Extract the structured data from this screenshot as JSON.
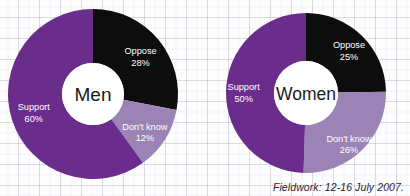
{
  "colors": {
    "support": "#6B2D8C",
    "oppose": "#0D0D0D",
    "dont_know": "#9B83B5",
    "hole": "#FFFFFF",
    "label_text": "#FFFFFF",
    "center_text": "#1A1A1A",
    "background": "#FDFDFE",
    "grid_line": "#A8A0BE",
    "footer_text": "#2C2330"
  },
  "footer": {
    "text": "Fieldwork: 12-16 July 2007."
  },
  "charts": [
    {
      "id": "men",
      "center_label": "Men",
      "segments": [
        {
          "label": "Oppose",
          "value": 28,
          "value_text": "28%",
          "color_key": "oppose"
        },
        {
          "label": "Don't know",
          "value": 12,
          "value_text": "12%",
          "color_key": "dont_know"
        },
        {
          "label": "Support",
          "value": 60,
          "value_text": "60%",
          "color_key": "support"
        }
      ]
    },
    {
      "id": "women",
      "center_label": "Women",
      "segments": [
        {
          "label": "Oppose",
          "value": 25,
          "value_text": "25%",
          "color_key": "oppose"
        },
        {
          "label": "Don't know",
          "value": 26,
          "value_text": "26%",
          "color_key": "dont_know"
        },
        {
          "label": "Support",
          "value": 50,
          "value_text": "50%",
          "color_key": "support"
        }
      ]
    }
  ],
  "chart_data": {
    "type": "pie",
    "title": "",
    "subtitle": "",
    "annotations": [
      "Fieldwork: 12-16 July 2007."
    ],
    "legend": "none (labels drawn on slices)",
    "charts": [
      {
        "name": "Men",
        "type": "pie",
        "variant": "donut",
        "categories": [
          "Oppose",
          "Don't know",
          "Support"
        ],
        "values": [
          28,
          12,
          60
        ],
        "labels": [
          "28%",
          "12%",
          "60%"
        ],
        "colors": [
          "#0D0D0D",
          "#9B83B5",
          "#6B2D8C"
        ],
        "start_angle_deg": 0,
        "direction": "clockwise",
        "inner_radius_ratio": 0.365
      },
      {
        "name": "Women",
        "type": "pie",
        "variant": "donut",
        "categories": [
          "Oppose",
          "Don't know",
          "Support"
        ],
        "values": [
          25,
          26,
          50
        ],
        "labels": [
          "25%",
          "26%",
          "50%"
        ],
        "colors": [
          "#0D0D0D",
          "#9B83B5",
          "#6B2D8C"
        ],
        "start_angle_deg": 0,
        "direction": "clockwise",
        "inner_radius_ratio": 0.4
      }
    ]
  }
}
